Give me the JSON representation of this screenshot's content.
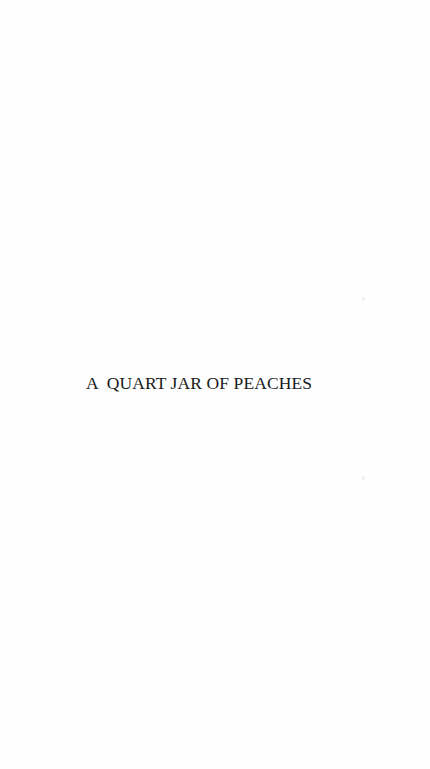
{
  "page": {
    "half_title": "A  QUART JAR OF PEACHES",
    "background_color": "#ffffff",
    "text_color": "#1a1a1a"
  }
}
